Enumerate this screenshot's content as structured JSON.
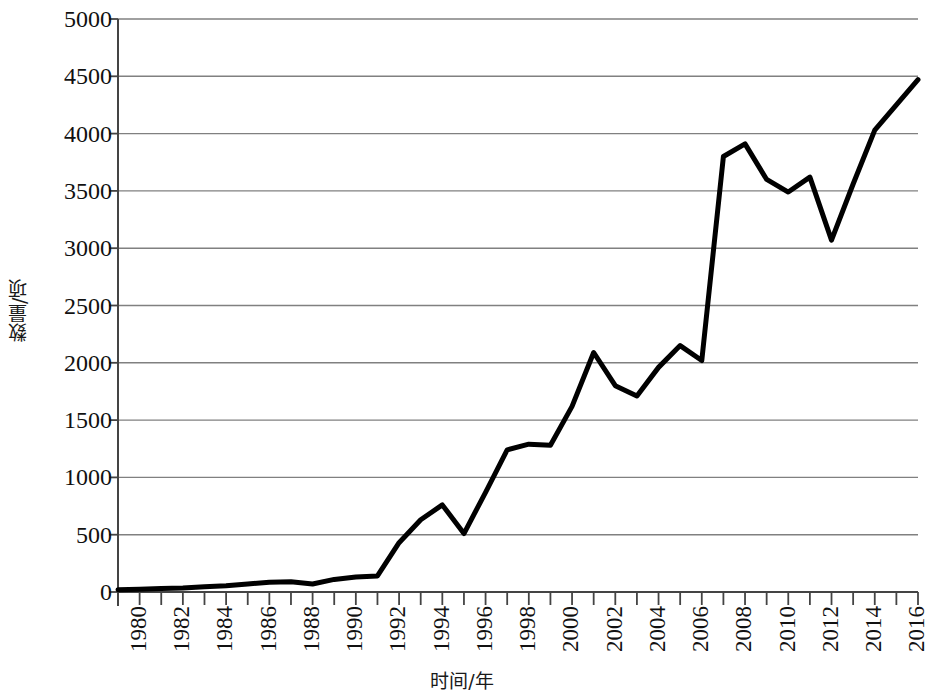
{
  "chart_data": {
    "type": "line",
    "title": "",
    "xlabel": "时间/年",
    "ylabel": "数量/项",
    "xlim": [
      1980,
      2017
    ],
    "ylim": [
      0,
      5000
    ],
    "grid": true,
    "legend": null,
    "line_color": "#000000",
    "gridline_color": "#808080",
    "axis_color": "#555555",
    "background_color": "#ffffff",
    "y_ticks": [
      0,
      500,
      1000,
      1500,
      2000,
      2500,
      3000,
      3500,
      4000,
      4500,
      5000
    ],
    "y_tick_labels": [
      "0",
      "500",
      "1000",
      "1500",
      "2000",
      "2500",
      "3000",
      "3500",
      "4000",
      "4500",
      "5000"
    ],
    "x_ticks": [
      1980,
      1981,
      1982,
      1983,
      1984,
      1985,
      1986,
      1987,
      1988,
      1989,
      1990,
      1991,
      1992,
      1993,
      1994,
      1995,
      1996,
      1997,
      1998,
      1999,
      2000,
      2001,
      2002,
      2003,
      2004,
      2005,
      2006,
      2007,
      2008,
      2009,
      2010,
      2011,
      2012,
      2013,
      2014,
      2015,
      2016,
      2017
    ],
    "x_tick_labels": [
      "1980",
      "1982",
      "1984",
      "1986",
      "1988",
      "1990",
      "1992",
      "1994",
      "1996",
      "1998",
      "2000",
      "2002",
      "2004",
      "2006",
      "2008",
      "2010",
      "2012",
      "2014",
      "2016"
    ],
    "x_tick_label_years": [
      1980,
      1982,
      1984,
      1986,
      1988,
      1990,
      1992,
      1994,
      1996,
      1998,
      2000,
      2002,
      2004,
      2006,
      2008,
      2010,
      2012,
      2014,
      2016
    ],
    "x": [
      1980,
      1981,
      1982,
      1983,
      1984,
      1985,
      1986,
      1987,
      1988,
      1989,
      1990,
      1991,
      1992,
      1993,
      1994,
      1995,
      1996,
      1997,
      1998,
      1999,
      2000,
      2001,
      2002,
      2003,
      2004,
      2005,
      2006,
      2007,
      2008,
      2009,
      2010,
      2011,
      2012,
      2013,
      2014,
      2015,
      2016,
      2017
    ],
    "values": [
      20,
      25,
      30,
      35,
      45,
      55,
      70,
      85,
      90,
      70,
      110,
      130,
      140,
      430,
      630,
      760,
      510,
      870,
      1240,
      1290,
      1280,
      1620,
      2090,
      1800,
      1710,
      1960,
      2150,
      2020,
      3800,
      3910,
      3600,
      3490,
      3620,
      3070,
      3560,
      4030,
      4250,
      4470
    ]
  }
}
